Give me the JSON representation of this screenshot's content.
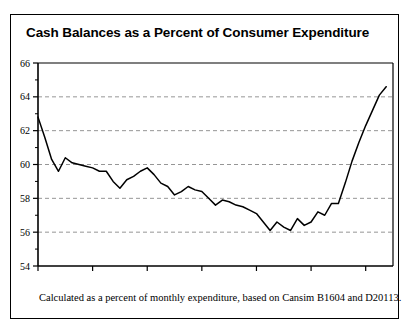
{
  "figure": {
    "title": "Cash Balances as a Percent of Consumer Expenditure",
    "caption": "Calculated as a percent of monthly expenditure, based on Cansim B1604 and D20113."
  },
  "chart_data": {
    "type": "line",
    "title": "Cash Balances as a Percent of Consumer Expenditure",
    "xlabel": "",
    "ylabel": "",
    "ylim": [
      54,
      66
    ],
    "xlim": [
      1981.0,
      1994.0
    ],
    "yticks": [
      54,
      56,
      58,
      60,
      62,
      64,
      66
    ],
    "ytick_labels": [
      "54",
      "56",
      "58",
      "60",
      "62",
      "64",
      "66"
    ],
    "xticks": [
      1981.0,
      1983.0,
      1985.0,
      1987.0,
      1989.0,
      1991.0,
      1993.0
    ],
    "xtick_labels": [
      "1981.1",
      "1983.1",
      "1985.1",
      "1987.1",
      "1989.1",
      "1991.1",
      "1993.1"
    ],
    "grid": "horizontal-dashed",
    "legend": "none",
    "line_color": "#000000",
    "series": [
      {
        "name": "Cash balances as percent of consumer expenditure",
        "x": [
          1981.0,
          1981.25,
          1981.5,
          1981.75,
          1982.0,
          1982.25,
          1982.5,
          1982.75,
          1983.0,
          1983.25,
          1983.5,
          1983.75,
          1984.0,
          1984.25,
          1984.5,
          1984.75,
          1985.0,
          1985.25,
          1985.5,
          1985.75,
          1986.0,
          1986.25,
          1986.5,
          1986.75,
          1987.0,
          1987.25,
          1987.5,
          1987.75,
          1988.0,
          1988.25,
          1988.5,
          1988.75,
          1989.0,
          1989.25,
          1989.5,
          1989.75,
          1990.0,
          1990.25,
          1990.5,
          1990.75,
          1991.0,
          1991.25,
          1991.5,
          1991.75,
          1992.0,
          1992.25,
          1992.5,
          1992.75,
          1993.0,
          1993.25,
          1993.5,
          1993.75
        ],
        "values": [
          62.8,
          61.6,
          60.3,
          59.6,
          60.4,
          60.1,
          60.0,
          59.9,
          59.8,
          59.6,
          59.6,
          59.0,
          58.6,
          59.1,
          59.3,
          59.6,
          59.8,
          59.4,
          58.9,
          58.7,
          58.2,
          58.4,
          58.7,
          58.5,
          58.4,
          58.0,
          57.6,
          57.9,
          57.8,
          57.6,
          57.5,
          57.3,
          57.1,
          56.6,
          56.1,
          56.6,
          56.3,
          56.1,
          56.8,
          56.4,
          56.6,
          57.2,
          57.0,
          57.7,
          57.7,
          58.9,
          60.2,
          61.3,
          62.3,
          63.2,
          64.1,
          64.6
        ]
      }
    ]
  }
}
